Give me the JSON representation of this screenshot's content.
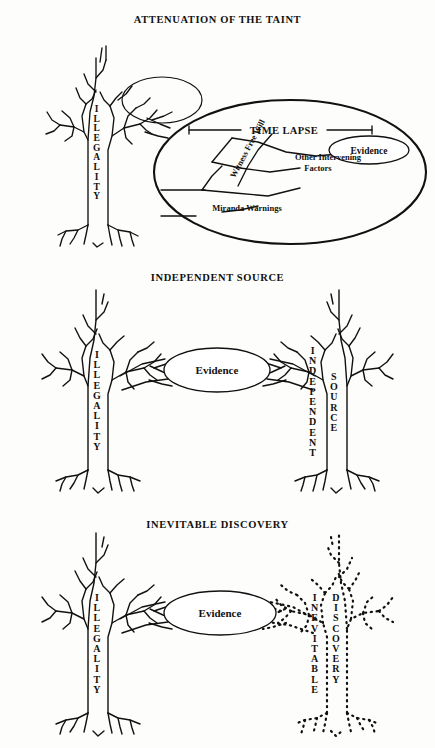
{
  "document": {
    "background_color": "#fdfdfb",
    "ink_color": "#111111",
    "panel_count": 3
  },
  "panels": [
    {
      "id": "attenuation",
      "title": "ATTENUATION OF THE TAINT",
      "tree_left": {
        "trunk_label": "ILLEGALITY",
        "style": "solid"
      },
      "magnifier": {
        "shape": "ellipse",
        "contents_label": "TIME LAPSE",
        "branch_labels": [
          "Witness Free Will",
          "Other Intervening Factors",
          "Miranda Warnings"
        ],
        "evidence_label": "Evidence"
      }
    },
    {
      "id": "independent",
      "title": "INDEPENDENT SOURCE",
      "tree_left": {
        "trunk_label": "ILLEGALITY",
        "style": "solid"
      },
      "tree_right": {
        "trunk_label_1": "INDEPENDENT",
        "trunk_label_2": "SOURCE",
        "style": "solid"
      },
      "evidence_label": "Evidence"
    },
    {
      "id": "inevitable",
      "title": "INEVITABLE DISCOVERY",
      "tree_left": {
        "trunk_label": "ILLEGALITY",
        "style": "solid"
      },
      "tree_right": {
        "trunk_label_1": "INEVITABLE",
        "trunk_label_2": "DISCOVERY",
        "style": "dotted"
      },
      "evidence_label": "Evidence"
    }
  ],
  "labels": {
    "illegality": "ILLEGALITY",
    "evidence": "Evidence",
    "time_lapse": "TIME LAPSE",
    "witness_free_will": "Witness Free Will",
    "other_intervening": "Other Intervening",
    "factors": "Factors",
    "miranda_warnings": "Miranda Warnings",
    "independent": "INDEPENDENT",
    "source": "SOURCE",
    "inevitable": "INEVITABLE",
    "discovery": "DISCOVERY"
  }
}
